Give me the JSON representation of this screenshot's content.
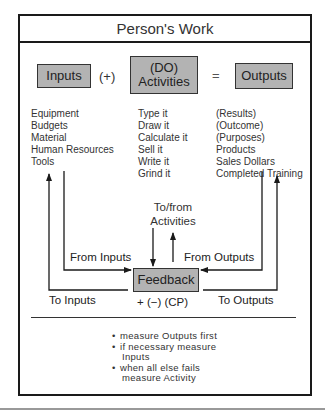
{
  "title": "Person's Work",
  "equation": {
    "inputs_label": "Inputs",
    "plus_label": "(+)",
    "activities_line1": "(DO)",
    "activities_line2": "Activities",
    "equals_label": "=",
    "outputs_label": "Outputs"
  },
  "inputs_list": [
    "Equipment",
    "Budgets",
    "Material",
    "Human Resources",
    "Tools"
  ],
  "activities_list": [
    "Type it",
    "Draw it",
    "Calculate it",
    "Sell it",
    "Write it",
    "Grind it"
  ],
  "outputs_list": [
    "(Results)",
    "(Outcome)",
    "(Purposes)",
    "Products",
    "Sales Dollars",
    "Completed Training"
  ],
  "feedback": {
    "to_from_line1": "To/from",
    "to_from_line2": "Activities",
    "from_inputs": "From Inputs",
    "from_outputs": "From Outputs",
    "box_label": "Feedback",
    "to_inputs": "To Inputs",
    "to_outputs": "To Outputs",
    "cp_label": "+ (−) (CP)"
  },
  "notes": {
    "bullet": "•",
    "items": [
      {
        "line1": "measure Outputs first"
      },
      {
        "line1": "if necessary measure",
        "line2": "Inputs"
      },
      {
        "line1": "when all else fails",
        "line2": "measure Activity"
      }
    ]
  }
}
